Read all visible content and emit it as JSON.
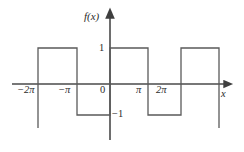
{
  "figure": {
    "kind": "function-graph",
    "width": 244,
    "height": 152,
    "background": "#ffffff",
    "curve_color": "#5a5a5a",
    "axis_color": "#4a4a4a",
    "text_color": "#2b2b2b"
  },
  "labels": {
    "y_axis": "f(x)",
    "x_axis": "x",
    "origin": "0",
    "y_tick_pos": "1",
    "y_tick_neg": "−1",
    "x_tick_m2pi": "−2π",
    "x_tick_mpi": "−π",
    "x_tick_pi": "π",
    "x_tick_2pi": "2π"
  },
  "chart_data": {
    "type": "line",
    "title": "",
    "xlabel": "x",
    "ylabel": "f(x)",
    "xlim": [
      -7.85,
      7.7
    ],
    "ylim": [
      -1.55,
      1.55
    ],
    "grid": false,
    "legend": null,
    "xticks": [
      -6.2832,
      -3.1416,
      0,
      3.1416,
      6.2832
    ],
    "xticklabels": [
      "−2π",
      "−π",
      "0",
      "π",
      "2π"
    ],
    "yticks": [
      -1,
      1
    ],
    "yticklabels": [
      "−1",
      "1"
    ],
    "series": [
      {
        "name": "f(x)",
        "description": "square wave, period 2π, amplitude 1",
        "x": [
          -6.28,
          -6.28,
          -3.14,
          -3.14,
          0.0,
          0.0,
          3.14,
          3.14,
          6.28,
          6.28,
          9.42
        ],
        "y": [
          -1,
          1,
          1,
          -1,
          -1,
          1,
          1,
          -1,
          -1,
          1,
          1
        ]
      }
    ],
    "segments": [
      {
        "x_start": -6.2832,
        "x_end": -3.1416,
        "value": 1
      },
      {
        "x_start": -3.1416,
        "x_end": 0.0,
        "value": -1
      },
      {
        "x_start": 0.0,
        "x_end": 3.1416,
        "value": 1
      },
      {
        "x_start": 3.1416,
        "x_end": 6.2832,
        "value": -1
      },
      {
        "x_start": 6.2832,
        "x_end": 9.4248,
        "value": 1
      }
    ]
  },
  "geometry": {
    "origin_px": {
      "x": 110,
      "y": 84
    },
    "top_level_px_y": 48,
    "bottom_level_px_y": 115,
    "x_breaks_px": [
      38,
      77,
      110,
      148,
      181,
      219
    ],
    "x_axis_arrow_tip_px": {
      "x": 230,
      "y": 84
    },
    "y_axis_arrow_tip_px": {
      "x": 110,
      "y": 12
    }
  }
}
